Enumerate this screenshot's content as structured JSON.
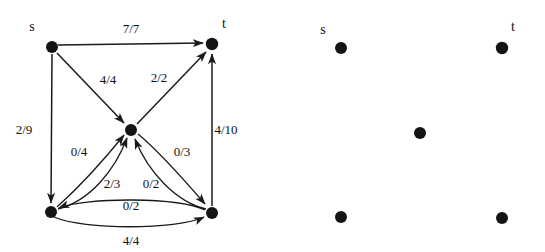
{
  "figure": {
    "background_color": "#ffffff",
    "node_color": "#141414",
    "edge_color": "#1a1a1a",
    "label_color": "#111111"
  },
  "panels": [
    {
      "id": "left-panel",
      "name": "flow-network-with-edges",
      "nodes": [
        {
          "id": "s",
          "label": "s",
          "x": 52,
          "y": 47,
          "r": 6.0,
          "label_x": 32,
          "label_y": 28
        },
        {
          "id": "t",
          "label": "t",
          "x": 212,
          "y": 44,
          "r": 6.2,
          "label_x": 224,
          "label_y": 25
        },
        {
          "id": "c",
          "label": "",
          "x": 131,
          "y": 130,
          "r": 6.0,
          "label_x": 0,
          "label_y": 0
        },
        {
          "id": "bl",
          "label": "",
          "x": 51,
          "y": 212,
          "r": 6.0,
          "label_x": 0,
          "label_y": 0
        },
        {
          "id": "br",
          "label": "",
          "x": 212,
          "y": 213,
          "r": 6.0,
          "label_x": 0,
          "label_y": 0
        }
      ],
      "edges": [
        {
          "id": "s-t",
          "from": "s",
          "to": "t",
          "label": "7/7",
          "label_x": 131,
          "label_y": 30,
          "shape": "straight"
        },
        {
          "id": "s-c",
          "from": "s",
          "to": "c",
          "label": "4/4",
          "label_x": 108,
          "label_y": 81,
          "shape": "straight"
        },
        {
          "id": "s-bl",
          "from": "s",
          "to": "bl",
          "label": "2/9",
          "label_x": 24,
          "label_y": 131,
          "shape": "straight"
        },
        {
          "id": "c-t",
          "from": "c",
          "to": "t",
          "label": "2/2",
          "label_x": 159,
          "label_y": 79,
          "shape": "straight"
        },
        {
          "id": "br-t",
          "from": "br",
          "to": "t",
          "label": "4/10",
          "label_x": 226,
          "label_y": 131,
          "shape": "straight"
        },
        {
          "id": "bl-c",
          "from": "bl",
          "to": "c",
          "label": "0/4",
          "label_x": 79,
          "label_y": 153,
          "shape": "curve-up"
        },
        {
          "id": "bl-c2",
          "from": "bl",
          "to": "c",
          "label": "2/3",
          "label_x": 112,
          "label_y": 185,
          "shape": "curve-low"
        },
        {
          "id": "br-c",
          "from": "br",
          "to": "c",
          "label": "0/2",
          "label_x": 151,
          "label_y": 185,
          "shape": "curve-low"
        },
        {
          "id": "c-br",
          "from": "c",
          "to": "br",
          "label": "0/3",
          "label_x": 182,
          "label_y": 153,
          "shape": "curve-down"
        },
        {
          "id": "br-bl",
          "from": "br",
          "to": "bl",
          "label": "0/2",
          "label_x": 131,
          "label_y": 207,
          "shape": "curve-flat-up"
        },
        {
          "id": "bl-br",
          "from": "bl",
          "to": "br",
          "label": "4/4",
          "label_x": 131,
          "label_y": 242,
          "shape": "curve-flat-down"
        }
      ]
    },
    {
      "id": "right-panel",
      "name": "node-layout-no-edges",
      "nodes": [
        {
          "id": "s",
          "label": "s",
          "x": 341,
          "y": 48,
          "r": 6.0,
          "label_x": 323,
          "label_y": 31
        },
        {
          "id": "t",
          "label": "t",
          "x": 502,
          "y": 48,
          "r": 6.2,
          "label_x": 513,
          "label_y": 28
        },
        {
          "id": "c",
          "label": "",
          "x": 420,
          "y": 133,
          "r": 6.0,
          "label_x": 0,
          "label_y": 0
        },
        {
          "id": "bl",
          "label": "",
          "x": 341,
          "y": 217,
          "r": 6.0,
          "label_x": 0,
          "label_y": 0
        },
        {
          "id": "br",
          "label": "",
          "x": 502,
          "y": 218,
          "r": 6.0,
          "label_x": 0,
          "label_y": 0
        }
      ],
      "edges": []
    }
  ]
}
